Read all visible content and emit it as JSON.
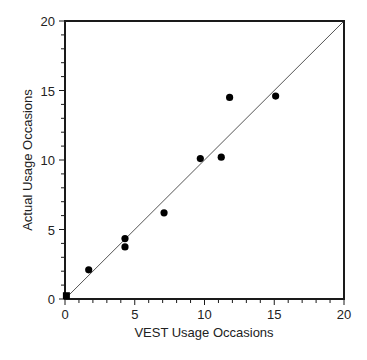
{
  "chart_data": {
    "type": "scatter",
    "title": "",
    "xlabel": "VEST Usage Occasions",
    "ylabel": "Actual Usage Occasions",
    "xlim": [
      0,
      20
    ],
    "ylim": [
      0,
      20
    ],
    "xticks": [
      0,
      5,
      10,
      15,
      20
    ],
    "yticks": [
      0,
      5,
      10,
      15,
      20
    ],
    "minor_tick_step": 1,
    "grid": false,
    "legend": null,
    "reference_line": {
      "label": "y = x",
      "from": [
        0,
        0
      ],
      "to": [
        20,
        20
      ]
    },
    "series": [
      {
        "name": "occasions",
        "points": [
          {
            "x": 0.1,
            "y": 0.2
          },
          {
            "x": 1.7,
            "y": 2.1
          },
          {
            "x": 4.3,
            "y": 4.35
          },
          {
            "x": 4.3,
            "y": 3.75
          },
          {
            "x": 7.1,
            "y": 6.2
          },
          {
            "x": 9.7,
            "y": 10.1
          },
          {
            "x": 11.2,
            "y": 10.2
          },
          {
            "x": 11.8,
            "y": 14.5
          },
          {
            "x": 15.1,
            "y": 14.6
          }
        ]
      }
    ]
  },
  "labels": {
    "x_axis": "VEST Usage Occasions",
    "y_axis": "Actual Usage Occasions"
  },
  "colors": {
    "axis": "#1a1a1a",
    "marker": "#000000",
    "line": "#555555"
  }
}
